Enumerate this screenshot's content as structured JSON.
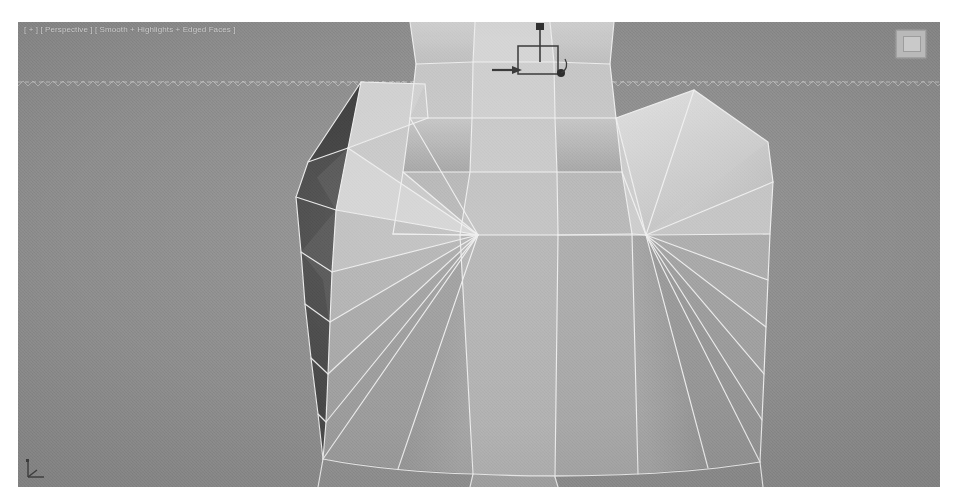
{
  "app": {
    "name": "3ds Max Viewport",
    "window_background": "#ffffff"
  },
  "viewport": {
    "label": "[ + ] [ Perspective ] [ Smooth + Highlights + Edged Faces ]",
    "label_color": "#d8d8d8",
    "background_color": "#8b8b8b",
    "shading_mode": "Smooth + Highlights + Edged Faces",
    "view": "Perspective",
    "bounds": {
      "x": 18,
      "y": 22,
      "width": 922,
      "height": 465
    }
  },
  "overlays": {
    "view_cube": {
      "name": "view-cube",
      "visible": true
    },
    "axis_tripod": {
      "name": "axis-tripod",
      "visible": true,
      "labels": [
        "x",
        "y",
        "z"
      ]
    },
    "horizon_line": {
      "visible": true,
      "style": "dashed-sawtooth",
      "y": 60,
      "color": "#e2e2e2"
    },
    "transform_gizmo": {
      "type": "move",
      "visible": true,
      "handles": [
        "z-axis-up",
        "xy-plane-square",
        "x-axis-right",
        "origin-dot"
      ],
      "color": "#3a3a3a"
    }
  },
  "mesh": {
    "name": "character-torso-shirt",
    "edge_color": "#f2f2f2",
    "edged_faces": true,
    "shading": {
      "lit_face": "#c9c9c9",
      "mid_face": "#a8a8a8",
      "body_face": "#9a9a9a",
      "shadow_face": "#7d7d7d",
      "dark_face": "#4a4a4a",
      "darkest_face": "#3b3b3b"
    },
    "topology": {
      "left_shoulder_fan_vertex": [
        460,
        213
      ],
      "right_shoulder_fan_vertex": [
        628,
        213
      ],
      "description": "Low-poly shirt / torso with triangle fans radiating from each shoulder vertex, dark left side panel, curved bottom hem"
    }
  }
}
